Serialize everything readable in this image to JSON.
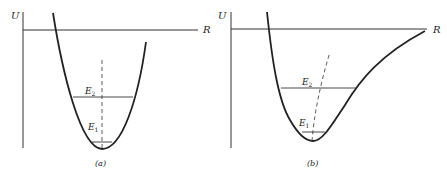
{
  "figure": {
    "panels": [
      {
        "id": "a",
        "caption": "(a)",
        "y_axis_label": "U",
        "x_axis_label": "R",
        "curve_type": "parabola",
        "levels": [
          {
            "name": "E",
            "sub": "2",
            "label": "E2"
          },
          {
            "name": "E",
            "sub": "1",
            "label": "E1"
          }
        ],
        "midpoint_locus": "vertical dashed line"
      },
      {
        "id": "b",
        "caption": "(b)",
        "y_axis_label": "U",
        "x_axis_label": "R",
        "curve_type": "anharmonic well",
        "levels": [
          {
            "name": "E",
            "sub": "2",
            "label": "E2"
          },
          {
            "name": "E",
            "sub": "1",
            "label": "E1"
          }
        ],
        "midpoint_locus": "curved dashed line tilting toward larger R"
      }
    ]
  },
  "colors": {
    "ink": "#222222",
    "background": "#ffffff"
  }
}
